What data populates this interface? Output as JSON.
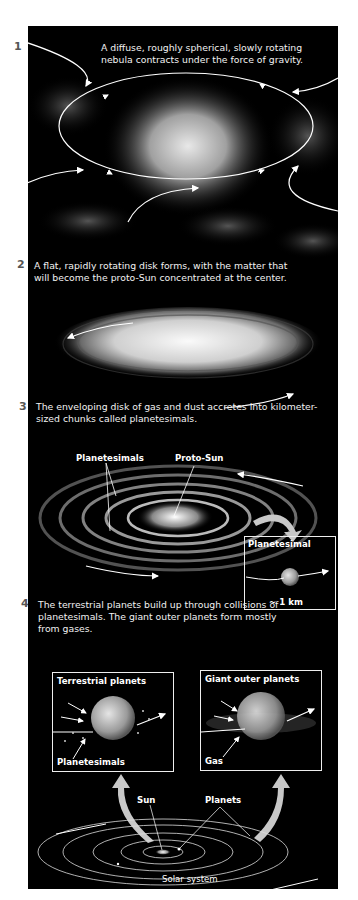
{
  "steps": [
    {
      "number": "1",
      "caption_line1": "A diffuse, roughly spherical, slowly rotating",
      "caption_line2": "nebula contracts under the force of gravity."
    },
    {
      "number": "2",
      "caption_line1": "A flat, rapidly rotating disk forms, with the matter that",
      "caption_line2": "will become the proto-Sun concentrated at the center."
    },
    {
      "number": "3",
      "caption_line1": "The enveloping disk of gas and dust accretes into kilometer-",
      "caption_line2": "sized chunks called planetesimals."
    },
    {
      "number": "4",
      "caption_line1": "The terrestrial planets build up through collisions of",
      "caption_line2": "planetesimals. The giant outer planets form mostly",
      "caption_line3": "from gases."
    }
  ],
  "labels": {
    "planetesimals": "Planetesimals",
    "proto_sun": "Proto-Sun",
    "planetesimal_inset_title": "Planetesimal",
    "scale": "~ 1 km",
    "terrestrial_title": "Terrestrial planets",
    "terrestrial_label": "Planetesimals",
    "giant_title": "Giant outer planets",
    "giant_label": "Gas",
    "sun": "Sun",
    "planets": "Planets",
    "solar_system": "Solar system"
  },
  "colors": {
    "background": "#000000",
    "page": "#ffffff",
    "text": "#ffffff",
    "step_number": "#555555",
    "arrow_fill": "#c8c8c8"
  }
}
